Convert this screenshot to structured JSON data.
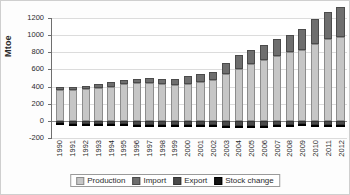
{
  "chart_data": {
    "type": "bar",
    "stacked": true,
    "title": "",
    "xlabel": "",
    "ylabel": "Mtoe",
    "ylim": [
      -200,
      1200
    ],
    "ytick_step": 200,
    "yticks": [
      1200,
      1000,
      800,
      600,
      400,
      200,
      0,
      -200
    ],
    "grid": true,
    "legend_position": "bottom",
    "categories": [
      "1990",
      "1991",
      "1992",
      "1993",
      "1994",
      "1995",
      "1996",
      "1997",
      "1998",
      "1999",
      "2000",
      "2001",
      "2002",
      "2003",
      "2004",
      "2005",
      "2006",
      "2007",
      "2008",
      "2009",
      "2010",
      "2011",
      "2012"
    ],
    "series": [
      {
        "name": "Production",
        "color": "#c6c6c6",
        "values": [
          360,
          365,
          375,
          385,
          400,
          430,
          445,
          440,
          425,
          420,
          430,
          455,
          475,
          545,
          610,
          665,
          710,
          760,
          800,
          825,
          895,
          950,
          980
        ]
      },
      {
        "name": "Import",
        "color": "#6e6e6e",
        "values": [
          30,
          32,
          35,
          42,
          48,
          45,
          45,
          55,
          60,
          70,
          90,
          88,
          100,
          125,
          160,
          160,
          180,
          195,
          200,
          250,
          290,
          320,
          350
        ]
      },
      {
        "name": "Export",
        "color": "#4a4a4a",
        "values": [
          -30,
          -32,
          -35,
          -32,
          -38,
          -42,
          -45,
          -48,
          -46,
          -45,
          -48,
          -48,
          -50,
          -58,
          -62,
          -60,
          -55,
          -52,
          -48,
          -42,
          -45,
          -45,
          -48
        ]
      },
      {
        "name": "Stock change",
        "color": "#141414",
        "values": [
          -5,
          -4,
          -5,
          -4,
          -5,
          -6,
          -8,
          -10,
          -12,
          -8,
          -6,
          -8,
          -8,
          -10,
          -12,
          -12,
          -14,
          -14,
          -16,
          -18,
          -20,
          -22,
          -22
        ]
      }
    ]
  },
  "legend": {
    "items": [
      {
        "label": "Production",
        "swatch": "production"
      },
      {
        "label": "Import",
        "swatch": "import"
      },
      {
        "label": "Export",
        "swatch": "export"
      },
      {
        "label": "Stock change",
        "swatch": "stock"
      }
    ]
  }
}
